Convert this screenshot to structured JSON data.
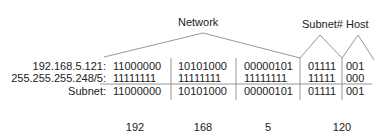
{
  "labels": {
    "network": "Network",
    "subnet_host": "Subnet# Host"
  },
  "rows": [
    {
      "label": "192.168.5.121:",
      "octets": [
        "11000000",
        "10101000",
        "00000101"
      ],
      "subnet": "01111",
      "host": "001"
    },
    {
      "label": "255.255.255.248/5:",
      "octets": [
        "11111111",
        "11111111",
        "11111111"
      ],
      "subnet": "11111",
      "host": "000"
    },
    {
      "label": "Subnet:",
      "octets": [
        "11000000",
        "10101000",
        "00000101"
      ],
      "subnet": "01111",
      "host": "001"
    }
  ],
  "decimals": [
    "192",
    "168",
    "5",
    "120"
  ],
  "colors": {
    "line": "#8a8a8a",
    "text": "#222222"
  }
}
